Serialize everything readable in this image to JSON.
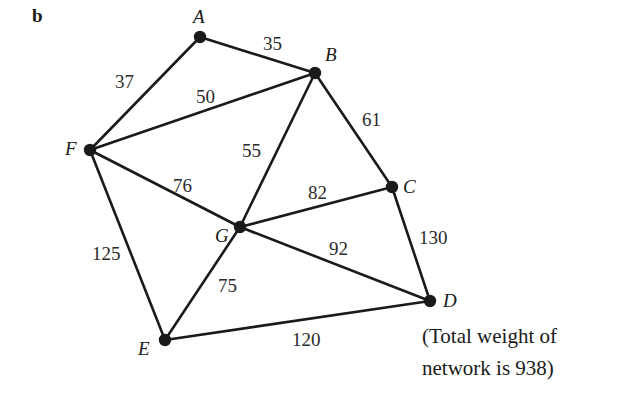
{
  "figure": {
    "panel_letter": "b",
    "caption_line1": "(Total weight of",
    "caption_line2": "network is 938)",
    "total_weight": 938,
    "stroke_color": "#1a1a1a",
    "node_color": "#1a1a1a",
    "background_color": "#ffffff"
  },
  "chart_data": {
    "type": "diagram",
    "title": "",
    "nodes": [
      {
        "id": "A",
        "label": "A",
        "x": 200,
        "y": 37,
        "label_x": 193,
        "label_y": 7
      },
      {
        "id": "B",
        "label": "B",
        "x": 315,
        "y": 73,
        "label_x": 325,
        "label_y": 45
      },
      {
        "id": "C",
        "label": "C",
        "x": 392,
        "y": 187,
        "label_x": 403,
        "label_y": 177
      },
      {
        "id": "D",
        "label": "D",
        "x": 430,
        "y": 301,
        "label_x": 443,
        "label_y": 291
      },
      {
        "id": "E",
        "label": "E",
        "x": 165,
        "y": 340,
        "label_x": 138,
        "label_y": 339
      },
      {
        "id": "F",
        "label": "F",
        "x": 90,
        "y": 150,
        "label_x": 65,
        "label_y": 139
      },
      {
        "id": "G",
        "label": "G",
        "x": 240,
        "y": 227,
        "label_x": 215,
        "label_y": 226
      }
    ],
    "edges": [
      {
        "from": "A",
        "to": "B",
        "weight": 35,
        "label_x": 263,
        "label_y": 34
      },
      {
        "from": "A",
        "to": "F",
        "weight": 37,
        "label_x": 115,
        "label_y": 72
      },
      {
        "from": "F",
        "to": "B",
        "weight": 50,
        "label_x": 196,
        "label_y": 87
      },
      {
        "from": "B",
        "to": "G",
        "weight": 55,
        "label_x": 242,
        "label_y": 141
      },
      {
        "from": "B",
        "to": "C",
        "weight": 61,
        "label_x": 362,
        "label_y": 110
      },
      {
        "from": "F",
        "to": "G",
        "weight": 76,
        "label_x": 173,
        "label_y": 176
      },
      {
        "from": "G",
        "to": "C",
        "weight": 82,
        "label_x": 308,
        "label_y": 183
      },
      {
        "from": "C",
        "to": "D",
        "weight": 130,
        "label_x": 419,
        "label_y": 228
      },
      {
        "from": "G",
        "to": "D",
        "weight": 92,
        "label_x": 329,
        "label_y": 239
      },
      {
        "from": "G",
        "to": "E",
        "weight": 75,
        "label_x": 218,
        "label_y": 276
      },
      {
        "from": "F",
        "to": "E",
        "weight": 125,
        "label_x": 92,
        "label_y": 244
      },
      {
        "from": "E",
        "to": "D",
        "weight": 120,
        "label_x": 292,
        "label_y": 330
      }
    ],
    "xlabel": "",
    "ylabel": "",
    "legend": []
  }
}
